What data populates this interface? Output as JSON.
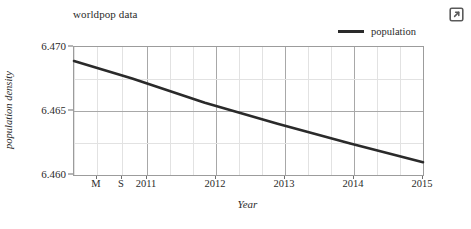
{
  "chart_data": {
    "type": "line",
    "title": "worldpop data",
    "xlabel": "Year",
    "ylabel": "population density",
    "grid": true,
    "legend_position": "top-right",
    "xlim": [
      2010.2,
      2015.0
    ],
    "ylim": [
      6.4595,
      6.4705
    ],
    "ytick_labels": [
      "6.470",
      "6.465",
      "6.460"
    ],
    "ytick_values": [
      6.47,
      6.465,
      6.46
    ],
    "xtick_labels": [
      "M",
      "S",
      "2011",
      "2012",
      "2013",
      "2014",
      "2015"
    ],
    "xtick_values": [
      2010.33,
      2010.67,
      2011,
      2012,
      2013,
      2014,
      2015
    ],
    "series": [
      {
        "name": "population",
        "color": "#2a2a2a",
        "x": [
          2010.2,
          2011,
          2012,
          2013,
          2014,
          2015
        ],
        "values": [
          6.4693,
          6.4678,
          6.4657,
          6.4639,
          6.4622,
          6.4606
        ]
      }
    ]
  },
  "chart": {
    "title": "worldpop data",
    "x_axis_title": "Year",
    "y_axis_title": "population density",
    "legend": [
      {
        "label": "population"
      }
    ],
    "y_ticks": [
      {
        "label": "6.470"
      },
      {
        "label": "6.465"
      },
      {
        "label": "6.460"
      }
    ],
    "x_ticks": [
      {
        "label": "M"
      },
      {
        "label": "S"
      },
      {
        "label": "2011"
      },
      {
        "label": "2012"
      },
      {
        "label": "2013"
      },
      {
        "label": "2014"
      },
      {
        "label": "2015"
      }
    ]
  },
  "toolbar": {
    "popout_icon": "external-link-icon"
  },
  "colors": {
    "series_line": "#2a2a2a",
    "grid_major": "#a8a8a8",
    "grid_minor": "#e2e2e2",
    "axis_border": "#9c9c9c",
    "text": "#2b2b2b",
    "background": "#ffffff"
  }
}
